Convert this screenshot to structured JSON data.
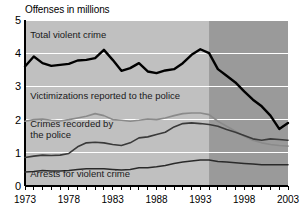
{
  "chart_data": {
    "type": "line",
    "title": "Offenses in millions",
    "xlabel": "",
    "ylabel": "Offenses in millions",
    "ylim": [
      0,
      5
    ],
    "xlim": [
      1973,
      2003
    ],
    "yticks": [
      "0",
      "1",
      "2",
      "3",
      "4",
      "5"
    ],
    "xticks": [
      "1973",
      "1978",
      "1983",
      "1988",
      "1993",
      "1998",
      "2003"
    ],
    "grid": "horizontal-white-gridlines",
    "legend_position": "inline-labels-on-plot",
    "shaded_band": {
      "label": "darker background shading",
      "from": 1994,
      "to": 2003,
      "color": "#9a9a9a"
    },
    "plot_background": "#c0c0c0",
    "x": [
      1973,
      1974,
      1975,
      1976,
      1977,
      1978,
      1979,
      1980,
      1981,
      1982,
      1983,
      1984,
      1985,
      1986,
      1987,
      1988,
      1989,
      1990,
      1991,
      1992,
      1993,
      1994,
      1995,
      1996,
      1997,
      1998,
      1999,
      2000,
      2001,
      2002,
      2003
    ],
    "series": [
      {
        "name": "Total violent crime",
        "color": "#000000",
        "width": 2.4,
        "values": [
          3.6,
          3.9,
          3.7,
          3.62,
          3.65,
          3.68,
          3.78,
          3.8,
          3.85,
          4.1,
          3.8,
          3.47,
          3.55,
          3.7,
          3.45,
          3.4,
          3.48,
          3.52,
          3.7,
          3.95,
          4.12,
          4.0,
          3.52,
          3.32,
          3.12,
          2.85,
          2.6,
          2.4,
          2.12,
          1.72,
          1.9
        ]
      },
      {
        "name": "Victimizations reported to the police",
        "color": "#8a8a8a",
        "width": 1.6,
        "values": [
          1.95,
          2.0,
          2.02,
          1.98,
          1.96,
          2.0,
          2.05,
          2.1,
          2.18,
          2.12,
          2.0,
          1.98,
          1.95,
          1.98,
          2.02,
          2.0,
          2.05,
          2.12,
          2.18,
          2.2,
          2.2,
          2.15,
          1.95,
          1.8,
          1.65,
          1.5,
          1.38,
          1.3,
          1.25,
          1.22,
          1.2
        ]
      },
      {
        "name": "Crimes recorded by the police",
        "color": "#3a3a3a",
        "width": 1.6,
        "values": [
          0.86,
          0.9,
          0.93,
          0.92,
          0.93,
          0.98,
          1.18,
          1.3,
          1.32,
          1.3,
          1.25,
          1.22,
          1.3,
          1.45,
          1.48,
          1.55,
          1.62,
          1.78,
          1.88,
          1.9,
          1.88,
          1.85,
          1.8,
          1.7,
          1.62,
          1.52,
          1.42,
          1.38,
          1.42,
          1.4,
          1.38
        ]
      },
      {
        "name": "Arrests for violent crime",
        "color": "#2a2a2a",
        "width": 1.5,
        "values": [
          0.42,
          0.44,
          0.47,
          0.45,
          0.45,
          0.47,
          0.5,
          0.52,
          0.52,
          0.52,
          0.5,
          0.48,
          0.5,
          0.55,
          0.55,
          0.58,
          0.62,
          0.68,
          0.72,
          0.75,
          0.78,
          0.78,
          0.74,
          0.72,
          0.7,
          0.68,
          0.66,
          0.64,
          0.64,
          0.64,
          0.64
        ]
      }
    ],
    "annotations": [
      {
        "text": "Total violent crime",
        "x": 1973.6,
        "y": 4.45
      },
      {
        "text": "Victimizations reported to the police",
        "x": 1973.6,
        "y": 2.62
      },
      {
        "text": "Crimes recorded by",
        "x": 1973.6,
        "y": 1.78
      },
      {
        "text": "the police",
        "x": 1973.6,
        "y": 1.46
      },
      {
        "text": "Arrests for violent crime",
        "x": 1973.6,
        "y": 0.28
      }
    ]
  }
}
